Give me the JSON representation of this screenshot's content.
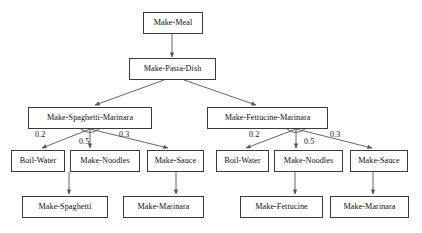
{
  "diagram": {
    "type": "and-or-task-network",
    "style": {
      "box_border_color": "#3a3a3a",
      "box_fill_color": "#ffffff",
      "edge_color": "#555555",
      "text_color": "#111111",
      "background_color": "#ffffff"
    },
    "nodes": [
      {
        "id": "make-meal",
        "label": "Make-Meal",
        "x": 143,
        "y": 12,
        "w": 60,
        "h": 22,
        "level": 0
      },
      {
        "id": "make-pasta-dish",
        "label": "Make-Pasta-Dish",
        "x": 129,
        "y": 58,
        "w": 87,
        "h": 22,
        "level": 1
      },
      {
        "id": "make-spaghetti-marinara",
        "label": "Make-Spaghetti-Marinara",
        "x": 28,
        "y": 107,
        "w": 124,
        "h": 22,
        "level": 2
      },
      {
        "id": "make-fettucine-marinara",
        "label": "Make-Fettucine-Marinara",
        "x": 207,
        "y": 107,
        "w": 121,
        "h": 22,
        "level": 2
      },
      {
        "id": "boil-water-left",
        "label": "Boil-Water",
        "x": 11,
        "y": 150,
        "w": 54,
        "h": 22,
        "level": 3
      },
      {
        "id": "make-noodles-left",
        "label": "Make-Noodles",
        "x": 70,
        "y": 150,
        "w": 70,
        "h": 22,
        "level": 3
      },
      {
        "id": "make-sauce-left",
        "label": "Make-Sauce",
        "x": 147,
        "y": 150,
        "w": 57,
        "h": 22,
        "level": 3
      },
      {
        "id": "boil-water-right",
        "label": "Boil-Water",
        "x": 216,
        "y": 150,
        "w": 53,
        "h": 22,
        "level": 3
      },
      {
        "id": "make-noodles-right",
        "label": "Make-Noodles",
        "x": 274,
        "y": 150,
        "w": 69,
        "h": 22,
        "level": 3
      },
      {
        "id": "make-sauce-right",
        "label": "Make-Sauce",
        "x": 350,
        "y": 150,
        "w": 58,
        "h": 22,
        "level": 3
      },
      {
        "id": "make-spaghetti",
        "label": "Make-Spaghetti",
        "x": 22,
        "y": 196,
        "w": 86,
        "h": 22,
        "level": 4
      },
      {
        "id": "make-marinara-left",
        "label": "Make-Marinara",
        "x": 123,
        "y": 196,
        "w": 81,
        "h": 22,
        "level": 4
      },
      {
        "id": "make-fettucine",
        "label": "Make-Fettucine",
        "x": 240,
        "y": 196,
        "w": 83,
        "h": 22,
        "level": 4
      },
      {
        "id": "make-marinara-right",
        "label": "Make-Marinara",
        "x": 330,
        "y": 196,
        "w": 79,
        "h": 22,
        "level": 4
      }
    ],
    "edges": [
      {
        "id": "e-meal-pasta",
        "from": "make-meal",
        "to": "make-pasta-dish",
        "label": ""
      },
      {
        "id": "e-pasta-spaghetti",
        "from": "make-pasta-dish",
        "to": "make-spaghetti-marinara",
        "label": ""
      },
      {
        "id": "e-pasta-fettucine",
        "from": "make-pasta-dish",
        "to": "make-fettucine-marinara",
        "label": ""
      },
      {
        "id": "e-sm-boil",
        "from": "make-spaghetti-marinara",
        "to": "boil-water-left",
        "label": "0.2"
      },
      {
        "id": "e-sm-noodles",
        "from": "make-spaghetti-marinara",
        "to": "make-noodles-left",
        "label": "0.5"
      },
      {
        "id": "e-sm-sauce",
        "from": "make-spaghetti-marinara",
        "to": "make-sauce-left",
        "label": "0.3"
      },
      {
        "id": "e-fm-boil",
        "from": "make-fettucine-marinara",
        "to": "boil-water-right",
        "label": "0.2"
      },
      {
        "id": "e-fm-noodles",
        "from": "make-fettucine-marinara",
        "to": "make-noodles-right",
        "label": "0.5"
      },
      {
        "id": "e-fm-sauce",
        "from": "make-fettucine-marinara",
        "to": "make-sauce-right",
        "label": "0.3"
      },
      {
        "id": "e-noodles-spaghetti",
        "from": "make-noodles-left",
        "to": "make-spaghetti",
        "label": ""
      },
      {
        "id": "e-sauce-marinara-l",
        "from": "make-sauce-left",
        "to": "make-marinara-left",
        "label": ""
      },
      {
        "id": "e-noodles-fettucine",
        "from": "make-noodles-right",
        "to": "make-fettucine",
        "label": ""
      },
      {
        "id": "e-sauce-marinara-r",
        "from": "make-sauce-right",
        "to": "make-marinara-right",
        "label": ""
      }
    ],
    "edge_labels": [
      {
        "id": "label-sm-02",
        "text": "0.2",
        "x": 35,
        "y": 131
      },
      {
        "id": "label-sm-05",
        "text": "0.5",
        "x": 79,
        "y": 138
      },
      {
        "id": "label-sm-03",
        "text": "0.3",
        "x": 119,
        "y": 131
      },
      {
        "id": "label-fm-02",
        "text": "0.2",
        "x": 249,
        "y": 131
      },
      {
        "id": "label-fm-05",
        "text": "0.5",
        "x": 304,
        "y": 138
      },
      {
        "id": "label-fm-03",
        "text": "0.3",
        "x": 330,
        "y": 131
      }
    ]
  }
}
